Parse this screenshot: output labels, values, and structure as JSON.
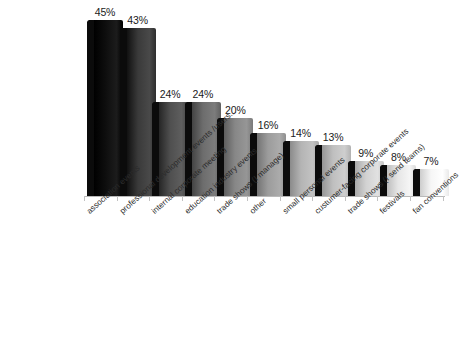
{
  "title_remnant": "· · ·  · · · · · · ·",
  "chart_data": {
    "type": "bar",
    "title": "",
    "subtitle": "",
    "xlabel": "",
    "ylabel": "",
    "ylim": [
      0,
      50
    ],
    "grid": false,
    "legend": "none",
    "value_label_suffix": "%",
    "categories": [
      "association events",
      "professional development events /users...",
      "internal corporate meeting",
      "education industry events",
      "trade shows (I manage)",
      "other",
      "small personal events",
      "custumer-facing corporate events",
      "trade shows (I send teams)",
      "festivals",
      "fan conventions"
    ],
    "values": [
      45,
      43,
      24,
      24,
      20,
      16,
      14,
      13,
      9,
      8,
      7
    ],
    "value_labels": [
      "45%",
      "43%",
      "24%",
      "24%",
      "20%",
      "16%",
      "14%",
      "13%",
      "9%",
      "8%",
      "7%"
    ],
    "bar_colors": [
      "#0d0d0d",
      "#3a3a3a",
      "#4f4f4f",
      "#6d6d6d",
      "#878787",
      "#9c9c9c",
      "#b4b4b4",
      "#bfbfbf",
      "#d2d2d2",
      "#e6e6e6",
      "#f6f6f6"
    ],
    "shadow_color": "#0b0b0b",
    "axis_color": "#b9b9b9",
    "background": "#ffffff"
  }
}
